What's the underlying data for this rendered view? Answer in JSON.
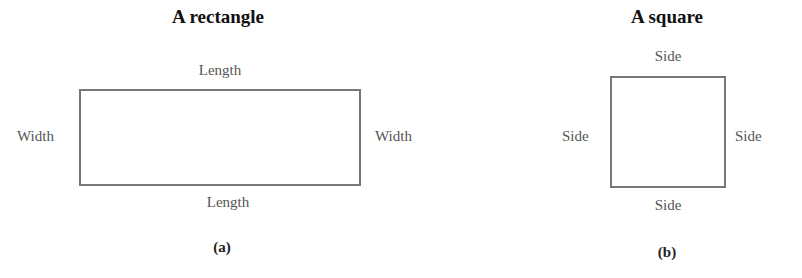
{
  "figure_a": {
    "title": "A rectangle",
    "shape": "rectangle",
    "labels": {
      "top": "Length",
      "bottom": "Length",
      "left": "Width",
      "right": "Width"
    },
    "caption": "(a)"
  },
  "figure_b": {
    "title": "A square",
    "shape": "square",
    "labels": {
      "top": "Side",
      "bottom": "Side",
      "left": "Side",
      "right": "Side"
    },
    "caption": "(b)"
  },
  "colors": {
    "outline": "#777777",
    "label_text": "#555555",
    "title_text": "#111111"
  }
}
